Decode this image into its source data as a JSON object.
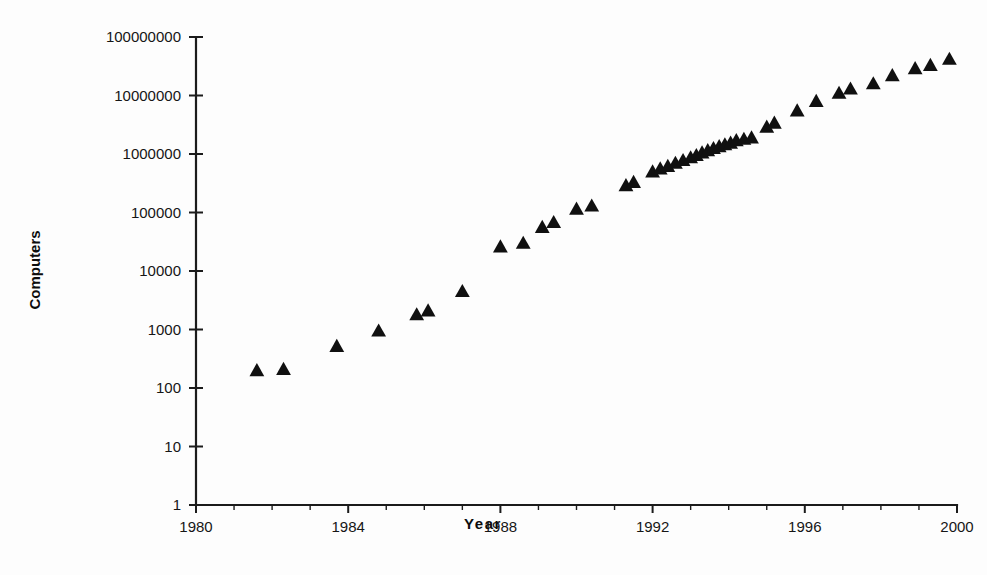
{
  "chart_data": {
    "type": "scatter",
    "title": "",
    "xlabel": "Year",
    "ylabel": "Computers",
    "yscale": "log",
    "xlim": [
      1980,
      2000
    ],
    "ylim": [
      1,
      100000000
    ],
    "grid": false,
    "legend": false,
    "marker": "triangle",
    "marker_color": "#101010",
    "x_tick_labels": [
      "1980",
      "1984",
      "1988",
      "1992",
      "1996",
      "2000"
    ],
    "x_tick_values": [
      1980,
      1984,
      1988,
      1992,
      1996,
      2000
    ],
    "x_minor_tick_step": 1,
    "y_tick_labels": [
      "1",
      "10",
      "100",
      "1000",
      "10000",
      "100000",
      "1000000",
      "10000000",
      "100000000"
    ],
    "y_tick_values": [
      1,
      10,
      100,
      1000,
      10000,
      100000,
      1000000,
      10000000,
      100000000
    ],
    "points": [
      {
        "x": 1981.6,
        "y": 200
      },
      {
        "x": 1982.3,
        "y": 210
      },
      {
        "x": 1983.7,
        "y": 520
      },
      {
        "x": 1984.8,
        "y": 950
      },
      {
        "x": 1985.8,
        "y": 1800
      },
      {
        "x": 1986.1,
        "y": 2100
      },
      {
        "x": 1987.0,
        "y": 4500
      },
      {
        "x": 1988.0,
        "y": 26000
      },
      {
        "x": 1988.6,
        "y": 30000
      },
      {
        "x": 1989.1,
        "y": 56000
      },
      {
        "x": 1989.4,
        "y": 68000
      },
      {
        "x": 1990.0,
        "y": 115000
      },
      {
        "x": 1990.4,
        "y": 130000
      },
      {
        "x": 1991.3,
        "y": 290000
      },
      {
        "x": 1991.5,
        "y": 330000
      },
      {
        "x": 1992.0,
        "y": 500000
      },
      {
        "x": 1992.2,
        "y": 560000
      },
      {
        "x": 1992.4,
        "y": 620000
      },
      {
        "x": 1992.6,
        "y": 700000
      },
      {
        "x": 1992.8,
        "y": 780000
      },
      {
        "x": 1993.0,
        "y": 870000
      },
      {
        "x": 1993.15,
        "y": 950000
      },
      {
        "x": 1993.3,
        "y": 1050000
      },
      {
        "x": 1993.45,
        "y": 1150000
      },
      {
        "x": 1993.6,
        "y": 1250000
      },
      {
        "x": 1993.75,
        "y": 1350000
      },
      {
        "x": 1993.9,
        "y": 1450000
      },
      {
        "x": 1994.05,
        "y": 1550000
      },
      {
        "x": 1994.2,
        "y": 1700000
      },
      {
        "x": 1994.4,
        "y": 1800000
      },
      {
        "x": 1994.6,
        "y": 1900000
      },
      {
        "x": 1995.0,
        "y": 2900000
      },
      {
        "x": 1995.2,
        "y": 3400000
      },
      {
        "x": 1995.8,
        "y": 5500000
      },
      {
        "x": 1996.3,
        "y": 8000000
      },
      {
        "x": 1996.9,
        "y": 11000000
      },
      {
        "x": 1997.2,
        "y": 13000000
      },
      {
        "x": 1997.8,
        "y": 16000000
      },
      {
        "x": 1998.3,
        "y": 22000000
      },
      {
        "x": 1998.9,
        "y": 29000000
      },
      {
        "x": 1999.3,
        "y": 33000000
      },
      {
        "x": 1999.8,
        "y": 42000000
      }
    ]
  }
}
